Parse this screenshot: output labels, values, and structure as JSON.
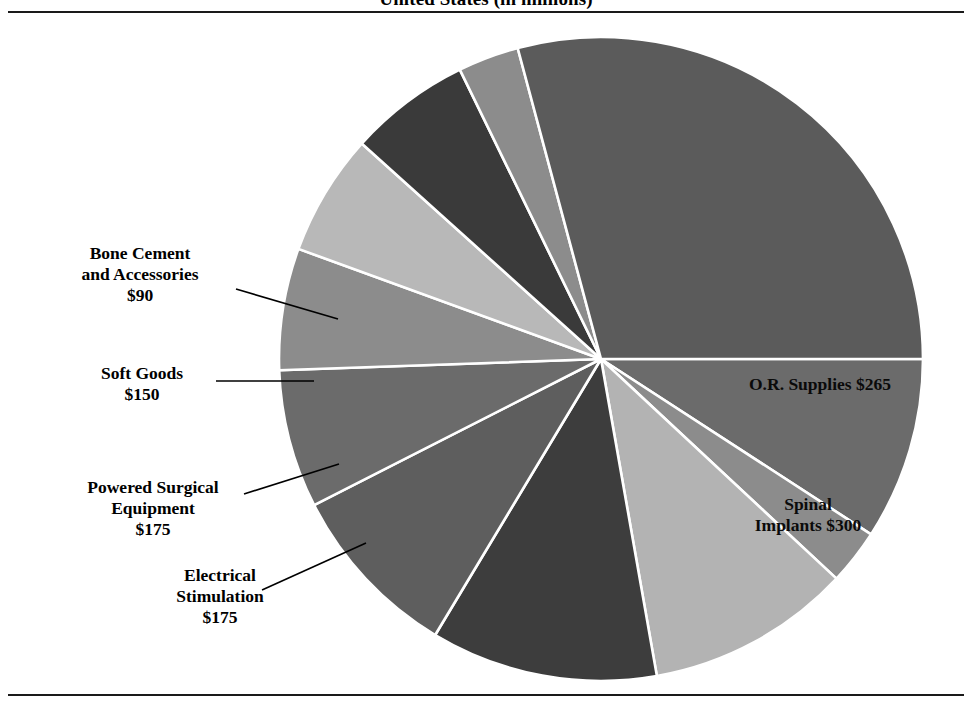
{
  "title": "United States (in millions)",
  "chart_data": {
    "type": "pie",
    "title": "United States (in millions)",
    "unit": "$ millions",
    "legend": "none",
    "labels_inside": true,
    "categories": [
      "O.R. Supplies",
      "Spinal Implants",
      "Electrical Stimulation",
      "Powered Surgical Equipment",
      "Soft Goods",
      "Bone Cement and Accessories"
    ],
    "values": [
      265,
      300,
      175,
      175,
      150,
      90
    ],
    "value_labels": [
      "$265",
      "$300",
      "$175",
      "$175",
      "$150",
      "$90"
    ],
    "slices": [
      {
        "name": "O.R. Supplies",
        "value": 265,
        "value_label": "$265",
        "labeled": true,
        "color": "#6b6b6b",
        "start_deg": 0,
        "end_deg": 33
      },
      {
        "name": "unlabeled-slice-1",
        "value": null,
        "value_label": "",
        "labeled": false,
        "color": "#8c8c8c",
        "start_deg": 33,
        "end_deg": 43
      },
      {
        "name": "Spinal Implants",
        "value": 300,
        "value_label": "$300",
        "labeled": true,
        "color": "#b3b3b3",
        "start_deg": 43,
        "end_deg": 80
      },
      {
        "name": "unlabeled-slice-2",
        "value": null,
        "value_label": "",
        "labeled": false,
        "color": "#3d3d3d",
        "start_deg": 80,
        "end_deg": 121
      },
      {
        "name": "unlabeled-slice-3",
        "value": null,
        "value_label": "",
        "labeled": false,
        "color": "#5e5e5e",
        "start_deg": 121,
        "end_deg": 153
      },
      {
        "name": "unlabeled-slice-4",
        "value": null,
        "value_label": "",
        "labeled": false,
        "color": "#6b6b6b",
        "start_deg": 153,
        "end_deg": 178
      },
      {
        "name": "Electrical Stimulation",
        "value": 175,
        "value_label": "$175",
        "labeled": true,
        "color": "#8c8c8c",
        "start_deg": 178,
        "end_deg": 200
      },
      {
        "name": "Powered Surgical Equipment",
        "value": 175,
        "value_label": "$175",
        "labeled": true,
        "color": "#b8b8b8",
        "start_deg": 200,
        "end_deg": 222
      },
      {
        "name": "Soft Goods",
        "value": 150,
        "value_label": "$150",
        "labeled": true,
        "color": "#3a3a3a",
        "start_deg": 222,
        "end_deg": 244
      },
      {
        "name": "Bone Cement and Accessories",
        "value": 90,
        "value_label": "$90",
        "labeled": true,
        "color": "#8c8c8c",
        "start_deg": 244,
        "end_deg": 255
      },
      {
        "name": "unlabeled-slice-5",
        "value": null,
        "value_label": "",
        "labeled": false,
        "color": "#5b5b5b",
        "start_deg": 255,
        "end_deg": 360
      }
    ],
    "geometry": {
      "center_x": 601,
      "center_y": 359,
      "radius": 322
    }
  },
  "labels": {
    "bone_cement": {
      "line1": "Bone Cement",
      "line2": "and Accessories",
      "amount": "$90"
    },
    "soft_goods": {
      "line1": "Soft Goods",
      "line2": "",
      "amount": "$150"
    },
    "powered": {
      "line1": "Powered Surgical",
      "line2": "Equipment",
      "amount": "$175"
    },
    "electrical": {
      "line1": "Electrical",
      "line2": "Stimulation",
      "amount": "$175"
    },
    "or_supplies": {
      "line1": "O.R. Supplies",
      "line2": "",
      "amount": "$265"
    },
    "spinal": {
      "line1": "Spinal",
      "line2": "Implants",
      "amount": "$300"
    }
  },
  "colors": {
    "rule": "#1a1a1a",
    "slice_edge": "#ffffff",
    "leader_line": "#000000",
    "background": "#ffffff"
  }
}
